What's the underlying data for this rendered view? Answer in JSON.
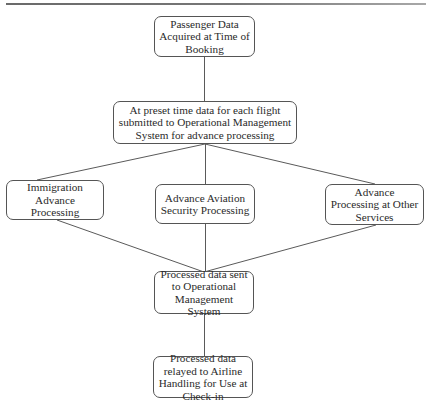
{
  "diagram": {
    "type": "flowchart",
    "nodes": [
      {
        "id": "n1",
        "label": "Passenger Data Acquired at Time of Booking"
      },
      {
        "id": "n2",
        "label": "At preset time data for each flight submitted to Operational Management System for advance processing"
      },
      {
        "id": "n3",
        "label": "Immigration Advance Processing"
      },
      {
        "id": "n4",
        "label": "Advance Aviation Security Processing"
      },
      {
        "id": "n5",
        "label": "Advance Processing at Other Services"
      },
      {
        "id": "n6",
        "label": "Processed data sent to Operational Management System"
      },
      {
        "id": "n7",
        "label": "Processed data relayed to Airline Handling for Use at Check-in"
      }
    ],
    "edges": [
      {
        "from": "n1",
        "to": "n2"
      },
      {
        "from": "n2",
        "to": "n3"
      },
      {
        "from": "n2",
        "to": "n4"
      },
      {
        "from": "n2",
        "to": "n5"
      },
      {
        "from": "n3",
        "to": "n6"
      },
      {
        "from": "n4",
        "to": "n6"
      },
      {
        "from": "n5",
        "to": "n6"
      },
      {
        "from": "n6",
        "to": "n7"
      }
    ],
    "colors": {
      "stroke": "#555555",
      "text": "#2a2a2a",
      "background": "#ffffff"
    }
  }
}
